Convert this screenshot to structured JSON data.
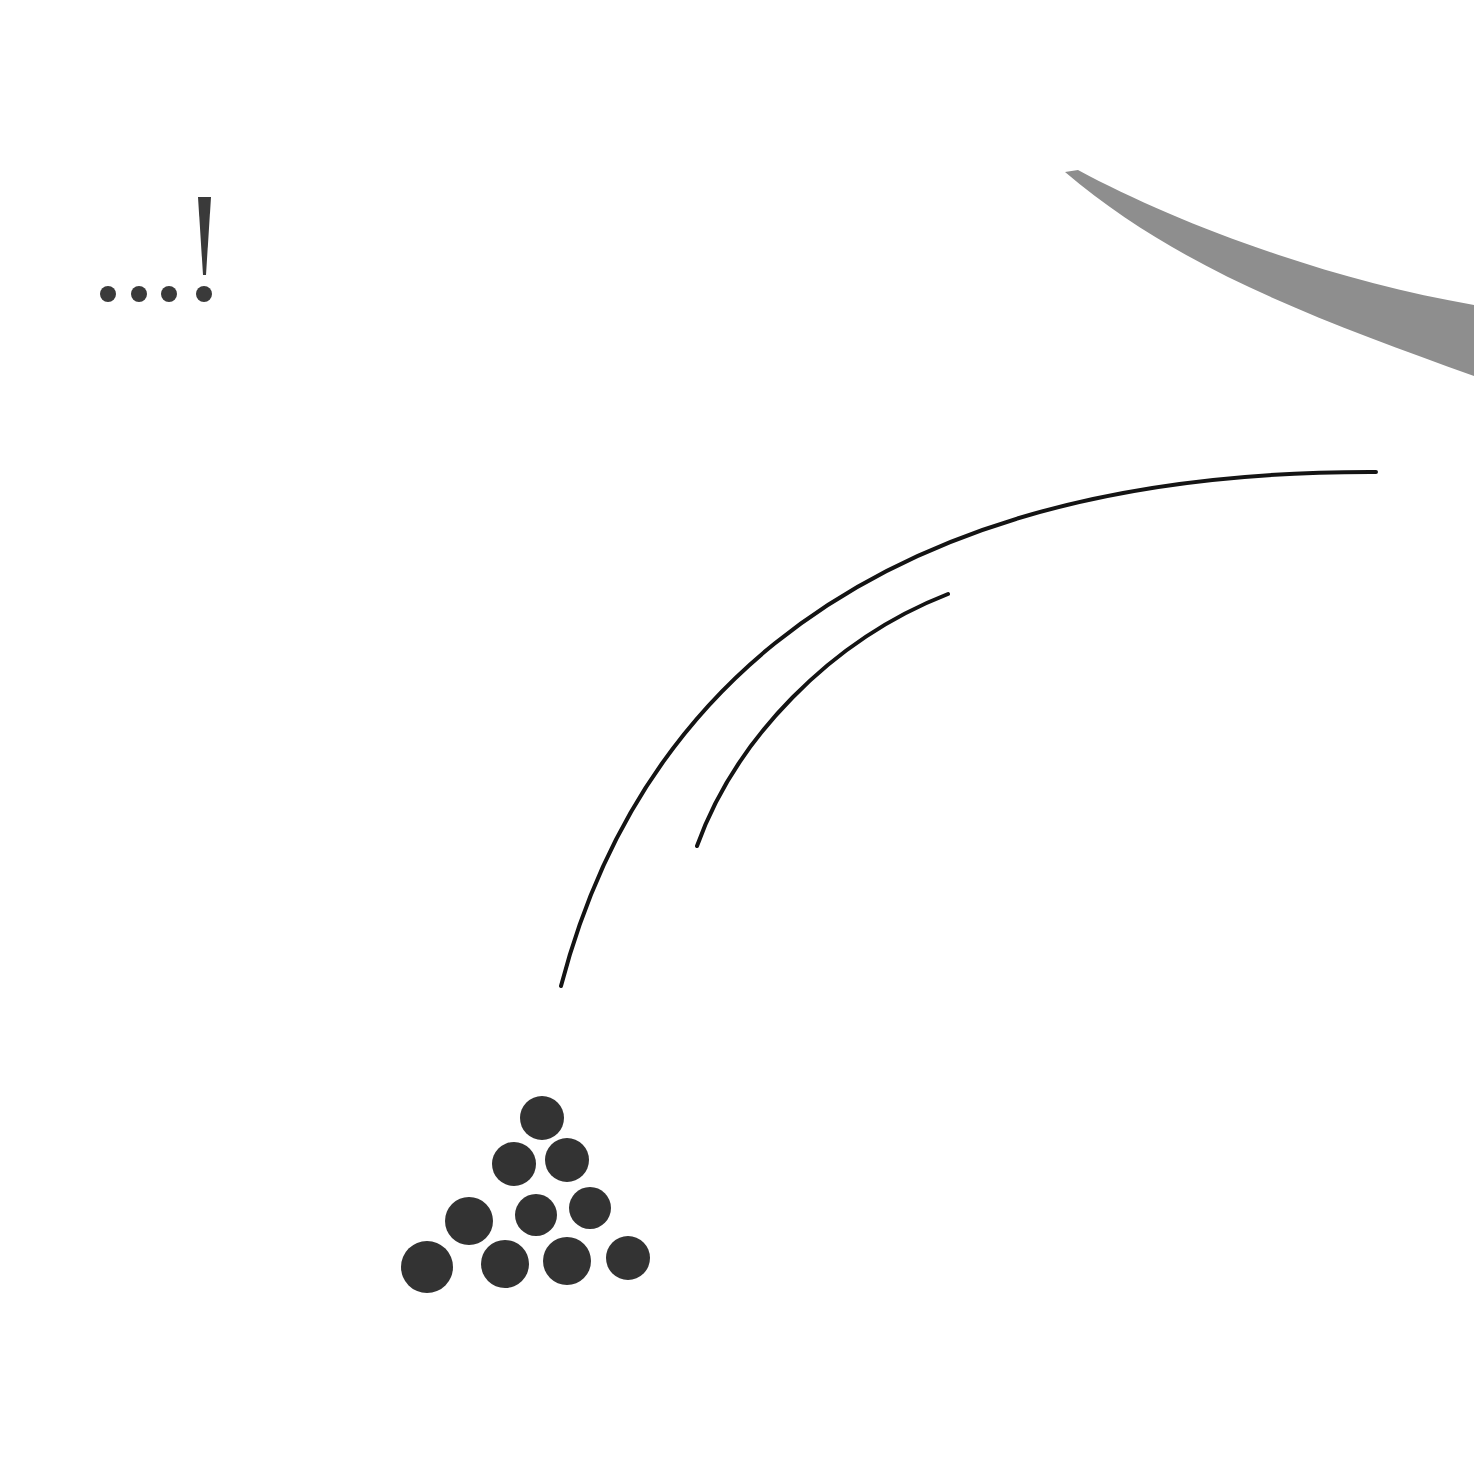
{
  "illustration": {
    "punctuation_label": "...!",
    "colors": {
      "background": "#ffffff",
      "ink": "#3a3a3a",
      "line": "#141414",
      "cue_stroke": "#8e8e8e"
    },
    "elements": [
      {
        "name": "ellipsis-exclamation-icon",
        "description": "three dots followed by an exclamation mark"
      },
      {
        "name": "cue-stick-stroke",
        "description": "grey tapered curved stroke at top right"
      },
      {
        "name": "motion-arc-outer",
        "description": "long curved motion line"
      },
      {
        "name": "motion-arc-inner",
        "description": "short curved motion line"
      },
      {
        "name": "billiard-ball-rack",
        "description": "ten balls in triangle formation (1,2,3,4)"
      }
    ],
    "ball_count": 10
  }
}
